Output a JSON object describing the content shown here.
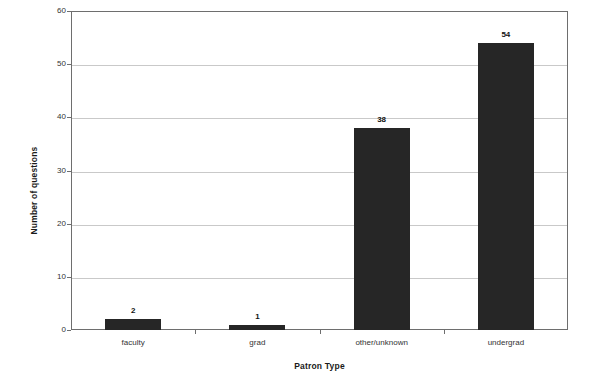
{
  "chart_data": {
    "type": "bar",
    "title": "",
    "xlabel": "Patron Type",
    "ylabel": "Number of questions",
    "categories": [
      "faculty",
      "grad",
      "other/unknown",
      "undergrad"
    ],
    "values": [
      2,
      1,
      38,
      54
    ],
    "value_labels": [
      "2",
      "1",
      "38",
      "54"
    ],
    "ylim": [
      0,
      60
    ],
    "y_ticks": [
      "0",
      "10",
      "20",
      "30",
      "40",
      "50",
      "60"
    ],
    "grid": true,
    "legend": "none",
    "bar_color": "#262626",
    "grid_color": "#c9c9c9",
    "axis_color": "#6e6e6e",
    "background_color": "#ffffff"
  }
}
